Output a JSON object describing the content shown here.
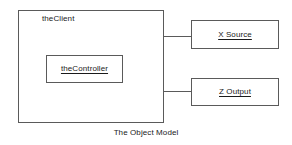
{
  "diagram": {
    "caption": "The Object Model",
    "colors": {
      "background": "#ffffff",
      "border": "#5a5a5a",
      "text": "#1a1a1a"
    },
    "nodes": {
      "client": {
        "label": "theClient",
        "underlined": false
      },
      "controller": {
        "label": "theController",
        "underlined": true
      },
      "x_source": {
        "label": "X Source",
        "underlined": true
      },
      "z_output": {
        "label": "Z Output",
        "underlined": true
      }
    },
    "connections": [
      {
        "from": "theController",
        "to": "X Source",
        "style": "orthogonal"
      },
      {
        "from": "theController",
        "to": "Z Output",
        "style": "orthogonal"
      }
    ]
  }
}
